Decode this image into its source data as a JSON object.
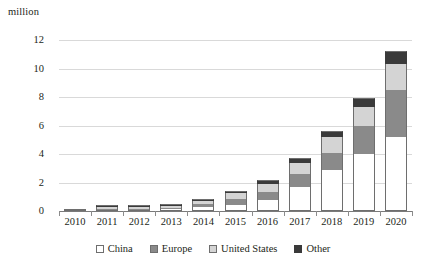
{
  "unit_label": "million",
  "chart_data": {
    "type": "bar",
    "title": "",
    "subtitle": "",
    "xlabel": "",
    "ylabel": "million",
    "stacked": true,
    "grid": true,
    "legend_position": "bottom",
    "ylim": [
      0,
      12
    ],
    "yticks": [
      0,
      2,
      4,
      6,
      8,
      10,
      12
    ],
    "ytick_labels": [
      "0",
      "2",
      "4",
      "6",
      "8",
      "10",
      "12"
    ],
    "categories": [
      "2010",
      "2011",
      "2012",
      "2013",
      "2014",
      "2015",
      "2016",
      "2017",
      "2018",
      "2019",
      "2020"
    ],
    "series": [
      {
        "name": "China",
        "color": "#ffffff",
        "values": [
          0.01,
          0.04,
          0.07,
          0.12,
          0.25,
          0.45,
          0.75,
          1.7,
          2.9,
          4.0,
          5.2
        ]
      },
      {
        "name": "Europe",
        "color": "#8a8a8a",
        "values": [
          0.0,
          0.02,
          0.04,
          0.11,
          0.22,
          0.4,
          0.6,
          0.9,
          1.2,
          2.0,
          3.3
        ]
      },
      {
        "name": "United States",
        "color": "#d4d4d4",
        "values": [
          0.01,
          0.02,
          0.04,
          0.1,
          0.22,
          0.4,
          0.58,
          0.8,
          1.1,
          1.3,
          1.8
        ]
      },
      {
        "name": "Other",
        "color": "#3a3a3a",
        "values": [
          0.0,
          0.04,
          0.06,
          0.09,
          0.14,
          0.18,
          0.27,
          0.3,
          0.4,
          0.6,
          0.9
        ]
      }
    ],
    "totals": [
      0.02,
      0.12,
      0.21,
      0.42,
      0.83,
      1.43,
      2.2,
      3.7,
      5.6,
      7.9,
      11.2
    ]
  },
  "legend": {
    "items": [
      {
        "label": "China",
        "swatch": "china"
      },
      {
        "label": "Europe",
        "swatch": "europe"
      },
      {
        "label": "United States",
        "swatch": "us"
      },
      {
        "label": "Other",
        "swatch": "other"
      }
    ]
  }
}
